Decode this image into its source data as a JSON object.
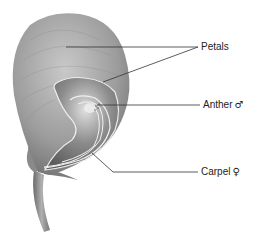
{
  "diagram": {
    "labels": [
      {
        "id": "petals",
        "text": "Petals",
        "symbol": ""
      },
      {
        "id": "anther",
        "text": "Anther",
        "symbol": "♂"
      },
      {
        "id": "carpel",
        "text": "Carpel",
        "symbol": "♀"
      }
    ]
  },
  "colors": {
    "background": "#ffffff",
    "petal_fill": "#9a9a9a",
    "petal_light": "#c8c8c8",
    "inner_edge": "#e8e8e8",
    "leader_line": "#333333",
    "text": "#222222"
  }
}
